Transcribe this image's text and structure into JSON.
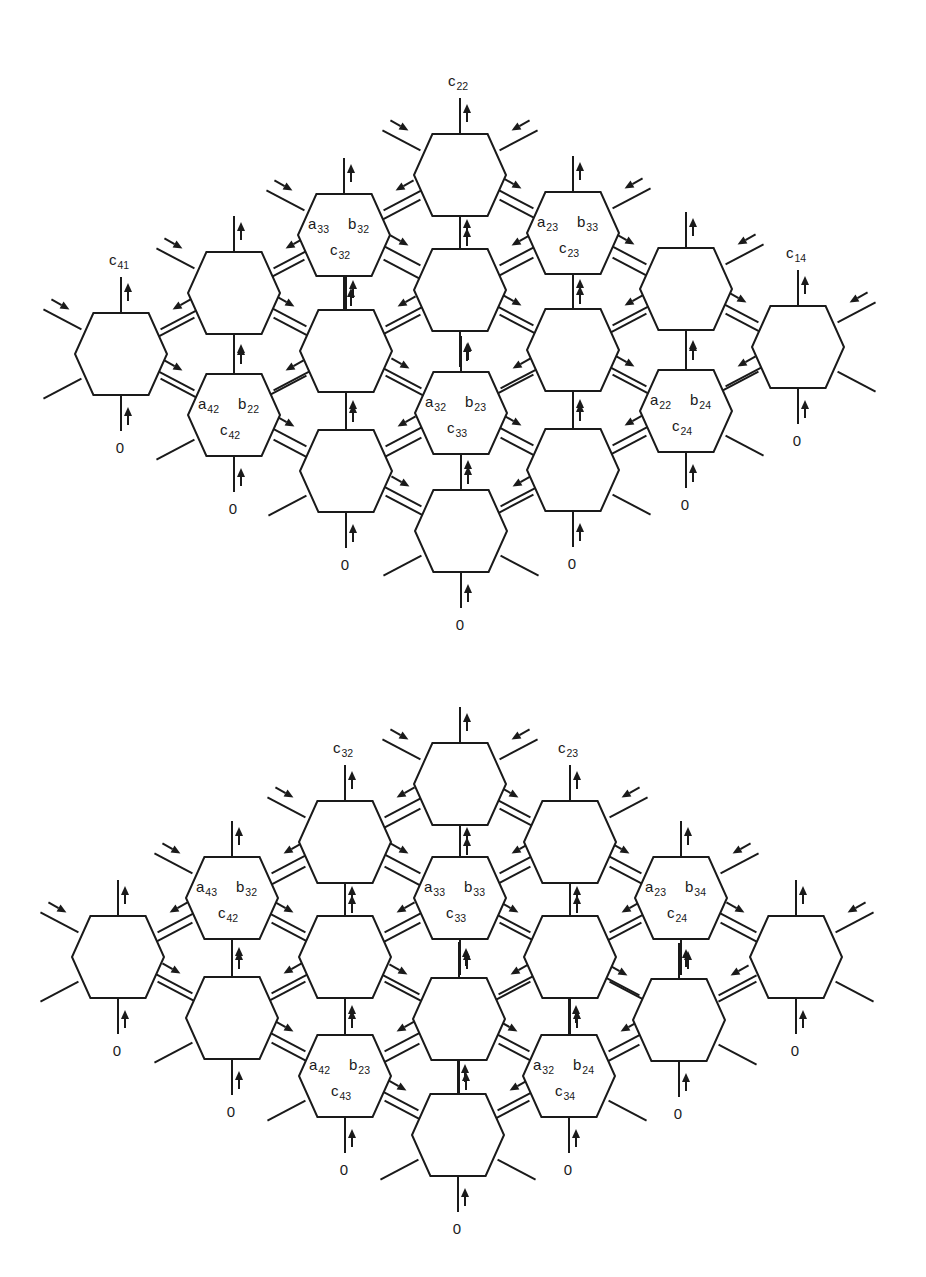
{
  "figure": {
    "panels": [
      {
        "id": "top",
        "hex_size": {
          "w": 92,
          "h": 82
        },
        "cells": [
          {
            "id": "t-c1-r1",
            "x": 121,
            "y": 354,
            "output_label": {
              "main": "c",
              "sub": "41"
            },
            "input_label": "0"
          },
          {
            "id": "t-c2-r1",
            "x": 234,
            "y": 293
          },
          {
            "id": "t-c2-r2",
            "x": 234,
            "y": 415,
            "a": {
              "main": "a",
              "sub": "42"
            },
            "b": {
              "main": "b",
              "sub": "22"
            },
            "c": {
              "main": "c",
              "sub": "42"
            },
            "input_label": "0"
          },
          {
            "id": "t-c3-r1",
            "x": 344,
            "y": 235,
            "a": {
              "main": "a",
              "sub": "33"
            },
            "b": {
              "main": "b",
              "sub": "32"
            },
            "c": {
              "main": "c",
              "sub": "32"
            }
          },
          {
            "id": "t-c3-r2",
            "x": 346,
            "y": 351
          },
          {
            "id": "t-c3-r3",
            "x": 346,
            "y": 471,
            "input_label": "0"
          },
          {
            "id": "t-c4-r1",
            "x": 460,
            "y": 175,
            "output_label": {
              "main": "c",
              "sub": "22"
            }
          },
          {
            "id": "t-c4-r2",
            "x": 460,
            "y": 290
          },
          {
            "id": "t-c4-r3",
            "x": 461,
            "y": 413,
            "a": {
              "main": "a",
              "sub": "32"
            },
            "b": {
              "main": "b",
              "sub": "23"
            },
            "c": {
              "main": "c",
              "sub": "33"
            }
          },
          {
            "id": "t-c4-r4",
            "x": 461,
            "y": 531,
            "input_label": "0"
          },
          {
            "id": "t-c5-r1",
            "x": 573,
            "y": 233,
            "a": {
              "main": "a",
              "sub": "23"
            },
            "b": {
              "main": "b",
              "sub": "33"
            },
            "c": {
              "main": "c",
              "sub": "23"
            }
          },
          {
            "id": "t-c5-r2",
            "x": 573,
            "y": 350
          },
          {
            "id": "t-c5-r3",
            "x": 573,
            "y": 470,
            "input_label": "0"
          },
          {
            "id": "t-c6-r1",
            "x": 686,
            "y": 289
          },
          {
            "id": "t-c6-r2",
            "x": 686,
            "y": 411,
            "a": {
              "main": "a",
              "sub": "22"
            },
            "b": {
              "main": "b",
              "sub": "24"
            },
            "c": {
              "main": "c",
              "sub": "24"
            },
            "input_label": "0"
          },
          {
            "id": "t-c7-r1",
            "x": 798,
            "y": 347,
            "output_label": {
              "main": "c",
              "sub": "14"
            },
            "input_label": "0"
          }
        ]
      },
      {
        "id": "bottom",
        "hex_size": {
          "w": 92,
          "h": 82
        },
        "cells": [
          {
            "id": "b-c1-r1",
            "x": 118,
            "y": 957,
            "input_label": "0"
          },
          {
            "id": "b-c2-r1",
            "x": 232,
            "y": 898,
            "a": {
              "main": "a",
              "sub": "43"
            },
            "b": {
              "main": "b",
              "sub": "32"
            },
            "c": {
              "main": "c",
              "sub": "42"
            }
          },
          {
            "id": "b-c2-r2",
            "x": 232,
            "y": 1018,
            "input_label": "0"
          },
          {
            "id": "b-c3-r1",
            "x": 345,
            "y": 842,
            "output_label": {
              "main": "c",
              "sub": "32"
            }
          },
          {
            "id": "b-c3-r2",
            "x": 345,
            "y": 957
          },
          {
            "id": "b-c3-r3",
            "x": 345,
            "y": 1076,
            "a": {
              "main": "a",
              "sub": "42"
            },
            "b": {
              "main": "b",
              "sub": "23"
            },
            "c": {
              "main": "c",
              "sub": "43"
            },
            "input_label": "0"
          },
          {
            "id": "b-c4-r1",
            "x": 460,
            "y": 784
          },
          {
            "id": "b-c4-r2",
            "x": 460,
            "y": 898,
            "a": {
              "main": "a",
              "sub": "33"
            },
            "b": {
              "main": "b",
              "sub": "33"
            },
            "c": {
              "main": "c",
              "sub": "33"
            }
          },
          {
            "id": "b-c4-r3",
            "x": 459,
            "y": 1019
          },
          {
            "id": "b-c4-r4",
            "x": 458,
            "y": 1135,
            "input_label": "0"
          },
          {
            "id": "b-c5-r1",
            "x": 570,
            "y": 842,
            "output_label": {
              "main": "c",
              "sub": "23"
            }
          },
          {
            "id": "b-c5-r2",
            "x": 570,
            "y": 957
          },
          {
            "id": "b-c5-r3",
            "x": 569,
            "y": 1076,
            "a": {
              "main": "a",
              "sub": "32"
            },
            "b": {
              "main": "b",
              "sub": "24"
            },
            "c": {
              "main": "c",
              "sub": "34"
            },
            "input_label": "0"
          },
          {
            "id": "b-c6-r1",
            "x": 681,
            "y": 898,
            "a": {
              "main": "a",
              "sub": "23"
            },
            "b": {
              "main": "b",
              "sub": "34"
            },
            "c": {
              "main": "c",
              "sub": "24"
            }
          },
          {
            "id": "b-c6-r2",
            "x": 679,
            "y": 1020,
            "input_label": "0"
          },
          {
            "id": "b-c7-r1",
            "x": 796,
            "y": 957,
            "input_label": "0"
          }
        ]
      }
    ],
    "colors": {
      "ink": "#1a1a1a",
      "background": "#ffffff"
    }
  }
}
